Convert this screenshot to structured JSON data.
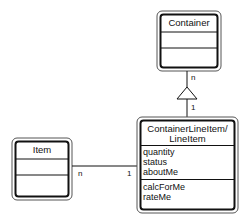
{
  "diagram": {
    "type": "uml-class-diagram",
    "classes": [
      {
        "id": "container",
        "name": "Container",
        "attributes": [],
        "operations": []
      },
      {
        "id": "item",
        "name": "Item",
        "attributes": [],
        "operations": []
      },
      {
        "id": "container-line-item",
        "name_line1": "ContainerLineItem/",
        "name_line2": "LineItem",
        "attributes": [
          "quantity",
          "status",
          "aboutMe"
        ],
        "operations": [
          "calcForMe",
          "rateMe"
        ]
      }
    ],
    "relationships": [
      {
        "from": "container-line-item",
        "to": "container",
        "kind": "aggregation-triangle",
        "from_multiplicity": "1",
        "to_multiplicity": "n"
      },
      {
        "from": "item",
        "to": "container-line-item",
        "kind": "association",
        "from_multiplicity": "n",
        "to_multiplicity": "1"
      }
    ]
  },
  "colors": {
    "line": "#111111",
    "outer_border": "#444444",
    "background": "#ffffff"
  }
}
